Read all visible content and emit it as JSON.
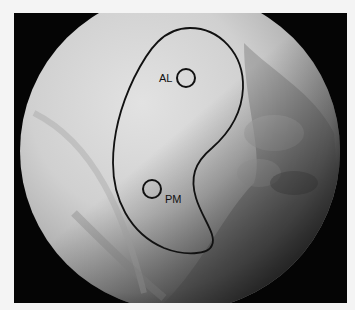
{
  "figure": {
    "type": "arthroscopic-image",
    "colors": {
      "background": "#f4f4f4",
      "frame": "#050505",
      "scope_light": "#d8d8d8",
      "scope_mid": "#a9a9a9",
      "outline": "#111111"
    }
  },
  "annotations": {
    "outline_shape": "kidney",
    "markers": [
      {
        "id": "al",
        "label": "AL"
      },
      {
        "id": "pm",
        "label": "PM"
      }
    ]
  }
}
